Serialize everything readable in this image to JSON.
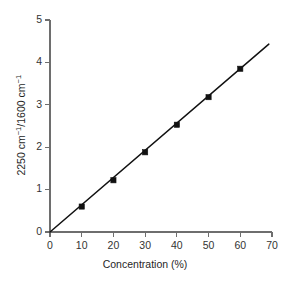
{
  "chart_data": {
    "type": "line",
    "title": "",
    "xlabel": "Concentration (%)",
    "ylabel": "2250 cm⁻¹/1600 cm⁻¹",
    "ylabel_parts": {
      "lead": "2250 cm",
      "sup1": "−1",
      "mid": "/1600 cm",
      "sup2": "−1"
    },
    "x": [
      10,
      20,
      30,
      40,
      50,
      60
    ],
    "values": [
      0.6,
      1.22,
      1.88,
      2.53,
      3.18,
      3.85
    ],
    "series": [
      {
        "name": "calibration",
        "x": [
          10,
          20,
          30,
          40,
          50,
          60
        ],
        "values": [
          0.6,
          1.22,
          1.88,
          2.53,
          3.18,
          3.85
        ],
        "marker": "square",
        "color": "#111111"
      }
    ],
    "fit_line": {
      "x_start": 0,
      "y_start": 0,
      "x_end": 69,
      "y_end": 4.43,
      "slope": 0.0642,
      "intercept": 0.0
    },
    "xlim": [
      0,
      70
    ],
    "ylim": [
      0,
      5
    ],
    "xticks": [
      0,
      10,
      20,
      30,
      40,
      50,
      60,
      70
    ],
    "yticks": [
      0,
      1,
      2,
      3,
      4,
      5
    ],
    "xticklabels": [
      "0",
      "10",
      "20",
      "30",
      "40",
      "50",
      "60",
      "70"
    ],
    "yticklabels": [
      "0",
      "1",
      "2",
      "3",
      "4",
      "5"
    ],
    "grid": false,
    "legend": null,
    "legend_position": "none",
    "annotations": []
  },
  "colors": {
    "background": "#ffffff",
    "axis": "#6e6e6e",
    "data": "#111111",
    "text": "#1f1f1f"
  }
}
